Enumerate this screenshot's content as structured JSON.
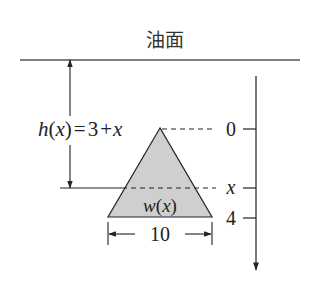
{
  "title": "油面",
  "depth_label": {
    "func": "h",
    "arg": "x",
    "equals": "=",
    "expr_const": "3",
    "expr_plus": "+",
    "expr_var": "x"
  },
  "width_label": {
    "func": "w",
    "arg": "x"
  },
  "dimension_label": "10",
  "axis": {
    "ticks": [
      {
        "label": "0",
        "italic": false
      },
      {
        "label": "x",
        "italic": true
      },
      {
        "label": "4",
        "italic": false
      }
    ]
  },
  "colors": {
    "stroke": "#222222",
    "triangle_fill": "#cfcfcf"
  }
}
